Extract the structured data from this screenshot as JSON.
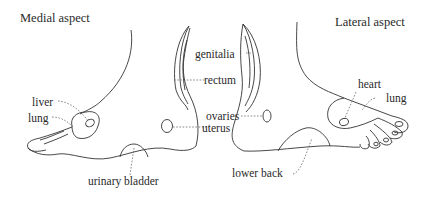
{
  "diagram": {
    "title_left": "Medial aspect",
    "title_right": "Lateral aspect",
    "medial_labels": {
      "liver": "liver",
      "lung": "lung",
      "urinary_bladder": "urinary bladder",
      "genitalia": "genitalia",
      "rectum": "rectum",
      "ovaries": "ovaries",
      "uterus": "uterus"
    },
    "lateral_labels": {
      "heart": "heart",
      "lung": "lung",
      "lower_back": "lower back"
    },
    "colors": {
      "line": "#333333",
      "text": "#2a2a2a",
      "background": "#ffffff"
    }
  }
}
